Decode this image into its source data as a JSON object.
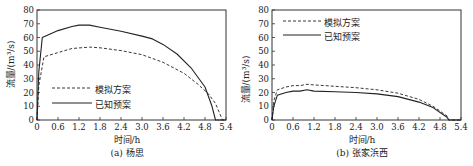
{
  "chart_data": [
    {
      "type": "line",
      "title": "",
      "caption": "(a) 杨思",
      "xlabel": "时间/h",
      "ylabel": "流量/(m³/s)",
      "xlim": [
        0,
        5.4
      ],
      "ylim": [
        0,
        80
      ],
      "xticks": [
        "0",
        "0.6",
        "1.2",
        "1.8",
        "2.4",
        "3.0",
        "3.6",
        "4.2",
        "4.8",
        "5.4"
      ],
      "yticks": [
        "0",
        "10",
        "20",
        "30",
        "40",
        "50",
        "60",
        "70",
        "80"
      ],
      "grid": false,
      "legend_position": "lower left",
      "series": [
        {
          "name": "模拟方案",
          "style": "dashed",
          "x": [
            0,
            0.05,
            0.2,
            0.6,
            1.0,
            1.5,
            1.8,
            2.4,
            3.0,
            3.6,
            4.2,
            4.6,
            4.9,
            5.1,
            5.2,
            5.3,
            5.4
          ],
          "y": [
            0,
            25,
            46,
            49,
            52,
            53,
            52.5,
            50.5,
            47.5,
            42,
            34,
            26,
            19,
            12,
            6,
            0,
            0
          ]
        },
        {
          "name": "已知预案",
          "style": "solid",
          "x": [
            0,
            0.05,
            0.15,
            0.6,
            1.0,
            1.2,
            1.5,
            1.8,
            2.4,
            3.0,
            3.3,
            3.6,
            4.0,
            4.4,
            4.8,
            5.0,
            5.1,
            5.4
          ],
          "y": [
            0,
            35,
            60,
            65,
            68,
            69,
            69,
            67.5,
            64.5,
            61,
            59,
            55,
            48,
            38,
            24,
            10,
            0,
            0
          ]
        }
      ]
    },
    {
      "type": "line",
      "title": "",
      "caption": "(b) 张家浜西",
      "xlabel": "时间/h",
      "ylabel": "流量/(m³/s)",
      "xlim": [
        0,
        5.4
      ],
      "ylim": [
        0,
        80
      ],
      "xticks": [
        "0",
        "0.6",
        "1.2",
        "1.8",
        "2.4",
        "3.0",
        "3.6",
        "4.2",
        "4.8",
        "5.4"
      ],
      "yticks": [
        "0",
        "10",
        "20",
        "30",
        "40",
        "50",
        "60",
        "70",
        "80"
      ],
      "grid": false,
      "legend_position": "upper left",
      "series": [
        {
          "name": "模拟方案",
          "style": "dashed",
          "x": [
            0,
            0.05,
            0.15,
            0.4,
            0.6,
            0.8,
            1.0,
            1.2,
            1.8,
            2.4,
            3.0,
            3.6,
            4.2,
            4.6,
            5.0,
            5.05,
            5.4
          ],
          "y": [
            0,
            14,
            22,
            24,
            25,
            25,
            26,
            25.5,
            24.5,
            23.5,
            22,
            19.5,
            15,
            10,
            3,
            0,
            0
          ]
        },
        {
          "name": "已知预案",
          "style": "solid",
          "x": [
            0,
            0.05,
            0.15,
            0.4,
            0.6,
            0.8,
            1.0,
            1.2,
            1.8,
            2.4,
            3.0,
            3.6,
            4.2,
            4.6,
            5.0,
            5.05,
            5.4
          ],
          "y": [
            0,
            10,
            18,
            20,
            21,
            21,
            22,
            21,
            20.5,
            20,
            19,
            17,
            13,
            9,
            2,
            0,
            0
          ]
        }
      ]
    }
  ],
  "figures": [
    {
      "caption": "(a) 杨思",
      "xlabel": "时间/h",
      "ylabel": "流量/(m³/s)",
      "legend": [
        "模拟方案",
        "已知预案"
      ]
    },
    {
      "caption": "(b) 张家浜西",
      "xlabel": "时间/h",
      "ylabel": "流量/(m³/s)",
      "legend": [
        "模拟方案",
        "已知预案"
      ]
    }
  ],
  "colors": {
    "line": "#222222",
    "axis": "#333333",
    "text": "#222222"
  }
}
